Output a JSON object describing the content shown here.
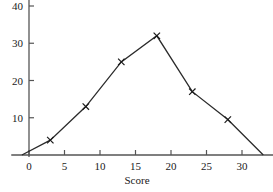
{
  "chart_data": {
    "type": "line",
    "title": "",
    "subtitle": "",
    "xlabel": "Score",
    "ylabel": "",
    "x": [
      -1,
      3,
      8,
      13,
      18,
      23,
      28,
      33
    ],
    "values": [
      0,
      4,
      13,
      25,
      32,
      17,
      9.5,
      0
    ],
    "series": [
      {
        "name": "Frequency",
        "x": [
          -1,
          3,
          8,
          13,
          18,
          23,
          28,
          33
        ],
        "values": [
          0,
          4,
          13,
          25,
          32,
          17,
          9.5,
          0
        ]
      }
    ],
    "xlim": [
      -2.5,
      34.5
    ],
    "ylim": [
      0,
      42
    ],
    "xticks": [
      0,
      5,
      10,
      15,
      20,
      25,
      30
    ],
    "xtick_labels": [
      "0",
      "5",
      "10",
      "15",
      "20",
      "25",
      "30"
    ],
    "yticks": [
      10,
      20,
      30,
      40
    ],
    "ytick_labels": [
      "10",
      "20",
      "30",
      "40"
    ],
    "grid": false,
    "legend": false,
    "legend_position": "none",
    "marker": "x",
    "line_color": "#2b2b2b",
    "marker_color": "#1a1a1a",
    "axis_color": "#555555",
    "annotations": []
  }
}
